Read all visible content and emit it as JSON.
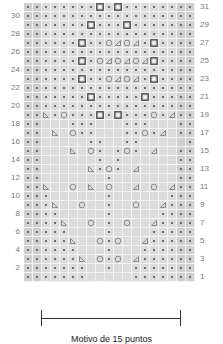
{
  "chart": {
    "columns": 19,
    "rows": 31,
    "edge_columns": [
      0,
      1,
      17,
      18
    ],
    "colors": {
      "cell": "#dcdcdc",
      "edge": "#cfcfcf",
      "grid": "#f4f4f4",
      "symbol": "#555555"
    },
    "legend_symbols": {
      "d": "purl-dot",
      "S": "bobble-square",
      "O": "yarn-over-circle",
      "L": "ssk-left-triangle",
      "R": "k2tog-right-triangle",
      ".": "knit-blank"
    },
    "grid": [
      "ddddddddSdSdddddddd",
      "ddddddddddddddddddd",
      "dddddddSdddSddddddd",
      "ddddddddddddddddddd",
      "ddddddSddORORdSdddd",
      "ddddddddddddddddddd",
      "ddddddSdORORORSdddd",
      "ddddddddddddddddddd",
      "ddddddSddORORdSdddd",
      "ddddddddddddddddddd",
      "dddddddSdddddSddddd",
      "ddddddddddddddddddd",
      "ddLdOdddSdSdddOdRdd",
      "dd...ddd...ddd...dd",
      "dd.L.Odd...ddOdR.dd",
      "dd.....dd..dd.....dd",
      "dd...L.Od.dOd.R..dd",
      "dd......d.d......dd",
      "dd.....LdOd.R....dd",
      "dd.......d.......dd",
      "ddL..O.L.O..R.O.Rdd",
      "ddd......d......ddd",
      "dddL..O..d..O..Rddd",
      "dddd.....d.....dddd",
      "ddddL..O.d.O..Rdddd",
      "ddddd....d....ddddd",
      "dddddL..OdO..Rddddd",
      "dddddd...d...dddddd",
      "ddddddL.OdO.Rdddddd",
      "ddddddd..d..ddddddd",
      "ddddddd.....ddddddd"
    ],
    "row_labels_left": [
      "30",
      "28",
      "26",
      "24",
      "22",
      "20",
      "18",
      "16",
      "14",
      "12",
      "10",
      "8",
      "6",
      "4",
      "2"
    ],
    "row_labels_right": [
      "31",
      "29",
      "27",
      "25",
      "23",
      "21",
      "19",
      "17",
      "15",
      "13",
      "11",
      "9",
      "7",
      "5",
      "3",
      "1"
    ]
  },
  "footer": {
    "repeat_caption": "Motivo de 15 puntos"
  }
}
